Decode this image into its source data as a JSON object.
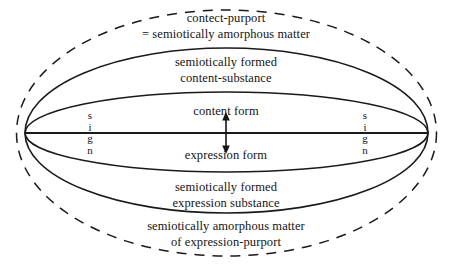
{
  "diagram": {
    "colors": {
      "background": "#ffffff",
      "stroke": "#1a1a1a",
      "text": "#141414"
    },
    "geometry": {
      "width": 455,
      "height": 267,
      "center_x": 226.5,
      "center_y": 133,
      "outer_dashed_rx": 210,
      "outer_dashed_ry": 123,
      "solid_vertex_left_x": 25,
      "solid_vertex_right_x": 428,
      "solid_outer_top_ry": 85,
      "solid_inner_top_ry": 41,
      "solid_inner_bottom_ry": 39,
      "solid_outer_bottom_ry": 80
    },
    "axis": {
      "name": "horizontal-center-axis",
      "from_x": 25,
      "to_x": 428,
      "y": 133
    },
    "arrow": {
      "name": "double-headed-vertical-arrow",
      "x": 226,
      "top_y": 114,
      "bottom_y": 152
    },
    "labels": {
      "content_purport_line1": "contect-purport",
      "content_purport_line2": "= semiotically amorphous matter",
      "content_substance_line1": "semiotically formed",
      "content_substance_line2": "content-substance",
      "content_form": "content form",
      "expression_form": "expression form",
      "expression_substance_line1": "semiotically formed",
      "expression_substance_line2": "expression substance",
      "expression_purport_line1": "semiotically amorphous matter",
      "expression_purport_line2": "of expression-purport"
    },
    "sign_labels": {
      "left": [
        "s",
        "i",
        "g",
        "n"
      ],
      "right": [
        "s",
        "i",
        "g",
        "n"
      ]
    }
  }
}
